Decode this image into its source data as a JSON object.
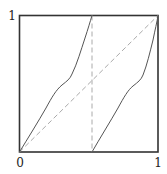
{
  "diagram": {
    "title": "",
    "type": "function-plot",
    "labels": {
      "y_top": "1",
      "x_origin": "0",
      "x_right": "1"
    },
    "colors": {
      "frame": "#333333",
      "curve": "#555555",
      "dashed": "#aaaaaa",
      "text": "#222222",
      "background": "#ffffff"
    },
    "elements": [
      {
        "id": "frame",
        "kind": "square-box",
        "from": [
          0,
          0
        ],
        "to": [
          1,
          1
        ]
      },
      {
        "id": "diagonal",
        "kind": "dashed-line",
        "from": [
          0,
          0
        ],
        "to": [
          1,
          1
        ]
      },
      {
        "id": "discontinuity",
        "kind": "dashed-line",
        "from": [
          0.525,
          0
        ],
        "to": [
          0.525,
          1
        ]
      },
      {
        "id": "left-branch",
        "kind": "curve",
        "from": [
          0,
          0
        ],
        "to": [
          0.525,
          1
        ],
        "description": "increasing S-shaped curve with inflection plateau near (0.35, 0.5)"
      },
      {
        "id": "right-branch",
        "kind": "curve",
        "from": [
          0.525,
          0
        ],
        "to": [
          1,
          1
        ],
        "description": "same S-shaped curve shifted right, plateau near (0.87, 0.52)"
      }
    ]
  }
}
